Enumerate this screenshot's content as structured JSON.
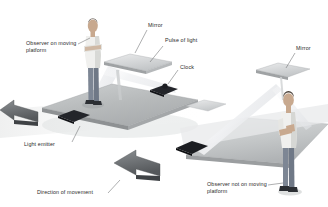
{
  "figure": {
    "background_color": "#ffffff",
    "width": 328,
    "height": 207
  },
  "labels": {
    "observer_moving": "Observer on moving platform",
    "observer_moving_line1": "Observer on",
    "observer_moving_line2": "moving platform",
    "mirror_top": "Mirror",
    "pulse_of_light": "Pulse of light",
    "clock": "Clock",
    "mirror_right": "Mirror",
    "light_emitter": "Light emitter",
    "direction_of_movement": "Direction of movement",
    "observer_not_moving": "Observer not on moving platform",
    "observer_not_moving_line1": "Observer not on",
    "observer_not_moving_line2": "moving platform"
  },
  "colors": {
    "platform_top": "#b9bcbd",
    "platform_top_light": "#d4d7d8",
    "platform_edge": "#8e9193",
    "platform_side": "#9a9d9f",
    "mirror_face": "#d8dadb",
    "mirror_edge": "#a9acad",
    "clock_dark": "#23252a",
    "arrow_dark": "#6f7376",
    "arrow_darker": "#4a4d50",
    "beam": "#e9eaec",
    "leader_line": "#6a6c6e",
    "text": "#2b2b2b",
    "skin": "#c8a98f",
    "shirt": "#f0f0ee",
    "jeans": "#7d8694",
    "hair": "#4a4038",
    "shoes": "#2c2f34"
  },
  "scene": {
    "left_scene_name": "moving-platform-frame",
    "right_scene_name": "stationary-observer-frame",
    "beam_path_moving_frame": "vertical up and down between emitter and mirror",
    "beam_path_rest_frame": "diagonal zig-zag due to platform motion"
  }
}
